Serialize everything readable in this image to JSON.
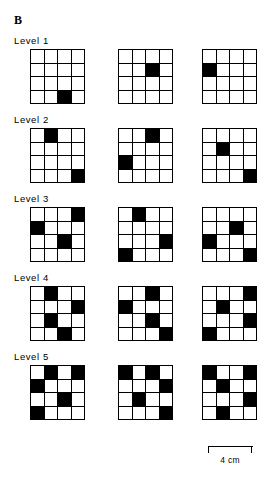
{
  "figure": {
    "panel_label": "B",
    "background_color": "#ffffff",
    "filled_cell_color": "#000000",
    "empty_cell_color": "#ffffff",
    "grid_line_color": "#000000",
    "grid_rows": 4,
    "grid_cols": 4,
    "patterns_per_level": 3
  },
  "scalebar": {
    "label": "4 cm"
  },
  "levels": [
    {
      "label": "Level 1",
      "filled_count": 1,
      "grids": [
        {
          "name": "level-1-pattern-1",
          "cells": [
            0,
            0,
            0,
            0,
            0,
            0,
            0,
            0,
            0,
            0,
            0,
            0,
            0,
            0,
            1,
            0
          ]
        },
        {
          "name": "level-1-pattern-2",
          "cells": [
            0,
            0,
            0,
            0,
            0,
            0,
            1,
            0,
            0,
            0,
            0,
            0,
            0,
            0,
            0,
            0
          ]
        },
        {
          "name": "level-1-pattern-3",
          "cells": [
            0,
            0,
            0,
            0,
            1,
            0,
            0,
            0,
            0,
            0,
            0,
            0,
            0,
            0,
            0,
            0
          ]
        }
      ]
    },
    {
      "label": "Level 2",
      "filled_count": 2,
      "grids": [
        {
          "name": "level-2-pattern-1",
          "cells": [
            0,
            1,
            0,
            0,
            0,
            0,
            0,
            0,
            0,
            0,
            0,
            0,
            0,
            0,
            0,
            1
          ]
        },
        {
          "name": "level-2-pattern-2",
          "cells": [
            0,
            0,
            1,
            0,
            0,
            0,
            0,
            0,
            1,
            0,
            0,
            0,
            0,
            0,
            0,
            0
          ]
        },
        {
          "name": "level-2-pattern-3",
          "cells": [
            0,
            0,
            0,
            0,
            0,
            1,
            0,
            0,
            0,
            0,
            0,
            0,
            0,
            0,
            0,
            1
          ]
        }
      ]
    },
    {
      "label": "Level 3",
      "filled_count": 3,
      "grids": [
        {
          "name": "level-3-pattern-1",
          "cells": [
            0,
            0,
            0,
            1,
            1,
            0,
            0,
            0,
            0,
            0,
            1,
            0,
            0,
            0,
            0,
            0
          ]
        },
        {
          "name": "level-3-pattern-2",
          "cells": [
            0,
            1,
            0,
            0,
            0,
            0,
            0,
            0,
            0,
            0,
            0,
            1,
            1,
            0,
            0,
            0
          ]
        },
        {
          "name": "level-3-pattern-3",
          "cells": [
            0,
            0,
            0,
            0,
            0,
            0,
            1,
            0,
            1,
            0,
            0,
            0,
            0,
            0,
            0,
            1
          ]
        }
      ]
    },
    {
      "label": "Level 4",
      "filled_count": 4,
      "grids": [
        {
          "name": "level-4-pattern-1",
          "cells": [
            0,
            1,
            0,
            0,
            0,
            0,
            0,
            1,
            0,
            1,
            0,
            0,
            0,
            0,
            1,
            0
          ]
        },
        {
          "name": "level-4-pattern-2",
          "cells": [
            0,
            0,
            1,
            0,
            1,
            0,
            0,
            0,
            0,
            0,
            1,
            0,
            0,
            0,
            0,
            1
          ]
        },
        {
          "name": "level-4-pattern-3",
          "cells": [
            0,
            0,
            0,
            1,
            0,
            1,
            0,
            0,
            0,
            0,
            0,
            1,
            1,
            0,
            0,
            0
          ]
        }
      ]
    },
    {
      "label": "Level 5",
      "filled_count": 5,
      "grids": [
        {
          "name": "level-5-pattern-1",
          "cells": [
            0,
            1,
            0,
            1,
            1,
            0,
            0,
            0,
            0,
            0,
            1,
            0,
            1,
            0,
            0,
            0
          ]
        },
        {
          "name": "level-5-pattern-2",
          "cells": [
            1,
            0,
            1,
            0,
            0,
            0,
            0,
            1,
            0,
            1,
            0,
            0,
            0,
            0,
            0,
            1
          ]
        },
        {
          "name": "level-5-pattern-3",
          "cells": [
            1,
            0,
            0,
            1,
            0,
            1,
            0,
            0,
            0,
            0,
            0,
            1,
            0,
            1,
            0,
            0
          ]
        }
      ]
    }
  ]
}
